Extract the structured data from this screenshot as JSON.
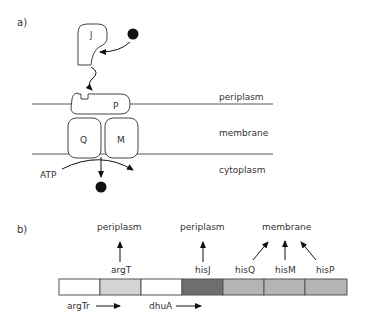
{
  "panel_a": {
    "label": "a)",
    "proteins": {
      "J": "J",
      "P": "P",
      "Q": "Q",
      "M": "M"
    },
    "compartments": {
      "periplasm": "periplasm",
      "membrane": "membrane",
      "cytoplasm": "cytoplasm"
    },
    "energy": "ATP"
  },
  "panel_b": {
    "label": "b)",
    "genes_top": [
      {
        "name": "argT",
        "location": "periplasm"
      },
      {
        "name": "hisJ",
        "location": "periplasm"
      },
      {
        "name": "hisQ",
        "location": "membrane"
      },
      {
        "name": "hisM",
        "location": "membrane"
      },
      {
        "name": "hisP",
        "location": "membrane"
      }
    ],
    "genes_bottom": [
      {
        "name": "argTr"
      },
      {
        "name": "dhuA"
      }
    ],
    "segment_colors": [
      "#ffffff",
      "#d4d4d4",
      "#ffffff",
      "#6e6e6e",
      "#b4b4b4",
      "#b4b4b4",
      "#b4b4b4"
    ]
  }
}
